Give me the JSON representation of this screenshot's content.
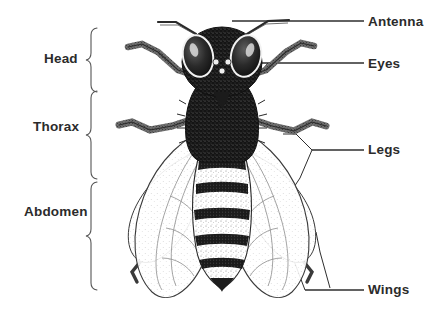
{
  "figure": {
    "background_color": "#ffffff",
    "ink_color": "#1a1a1a",
    "text_color": "#2b2b2b"
  },
  "labels": {
    "left": [
      {
        "id": "head",
        "text": "Head",
        "bracket": "curly-brace"
      },
      {
        "id": "thorax",
        "text": "Thorax",
        "bracket": "curly-brace"
      },
      {
        "id": "abdomen",
        "text": "Abdomen",
        "bracket": "curly-brace"
      }
    ],
    "right": [
      {
        "id": "antenna",
        "text": "Antenna",
        "leader": "horizontal-line"
      },
      {
        "id": "eyes",
        "text": "Eyes",
        "leader": "horizontal-line"
      },
      {
        "id": "legs",
        "text": "Legs",
        "leader": "branched-line"
      },
      {
        "id": "wings",
        "text": "Wings",
        "leader": "branched-line"
      }
    ]
  }
}
